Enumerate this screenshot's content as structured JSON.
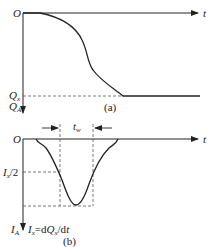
{
  "diagram": {
    "panel_a": {
      "origin_label": "O",
      "x_axis_label": "t",
      "level_label": "Q",
      "level_label_sub": "x",
      "y_axis_label": "Q",
      "y_axis_label_sub": "A",
      "caption": "(a)",
      "curve": "S-shaped cumulative charge, rising (downward) from 0 to Qx"
    },
    "panel_b": {
      "origin_label": "O",
      "x_axis_label": "t",
      "width_label": "t",
      "width_label_sub": "w",
      "half_label": "I",
      "half_label_sub": "x",
      "half_label_tail": "/2",
      "y_axis_label": "I",
      "y_axis_label_sub": "A",
      "formula_I": "I",
      "formula_I_sub": "x",
      "formula_eq": "=d",
      "formula_Q": "Q",
      "formula_Q_sub": "x",
      "formula_tail": "/d",
      "formula_t": "t",
      "caption": "(b)",
      "curve": "Bell-shaped current pulse Ix = dQx/dt with full width at half maximum tw"
    },
    "colors": {
      "line": "#222222",
      "dashed": "#555555",
      "background": "#ffffff"
    }
  }
}
